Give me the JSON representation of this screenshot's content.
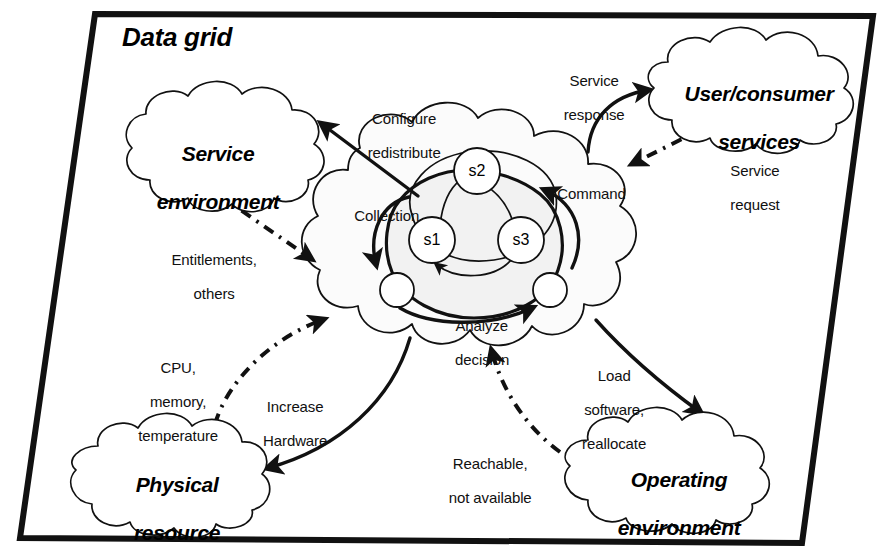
{
  "domain": "Diagram",
  "title": "Data grid",
  "colors": {
    "stroke": "#111111",
    "background": "#ffffff",
    "cloud_fill": "#ffffff",
    "inner_blob_fill": "#f2f2f2"
  },
  "frame": {
    "name": "data-grid-frame",
    "shape": "slanted-quadrilateral",
    "corners": [
      [
        95,
        14
      ],
      [
        873,
        16
      ],
      [
        802,
        543
      ],
      [
        20,
        538
      ]
    ]
  },
  "clouds": [
    {
      "id": "service-environment",
      "label": "Service\nenvironment",
      "line1": "Service",
      "line2": "environment",
      "cx": 207,
      "cy": 142
    },
    {
      "id": "user-consumer-services",
      "label": "User/consumer\nservices",
      "line1": "User/consumer",
      "line2": "services",
      "cx": 748,
      "cy": 85
    },
    {
      "id": "physical-resource",
      "label": "Physical\nresource",
      "line1": "Physical",
      "line2": "resource",
      "cx": 156,
      "cy": 473
    },
    {
      "id": "operating-environment",
      "label": "Operating\nenvironment",
      "line1": "Operating",
      "line2": "environment",
      "cx": 668,
      "cy": 468
    },
    {
      "id": "grid-cloud",
      "label": "",
      "line1": "",
      "line2": "",
      "cx": 470,
      "cy": 250
    }
  ],
  "nodes": [
    {
      "id": "s1",
      "label": "s1",
      "cx": 432,
      "cy": 240,
      "r": 23
    },
    {
      "id": "s2",
      "label": "s2",
      "cx": 477,
      "cy": 171,
      "r": 23
    },
    {
      "id": "s3",
      "label": "s3",
      "cx": 521,
      "cy": 240,
      "r": 23
    },
    {
      "id": "endpoint-left",
      "label": "",
      "cx": 397,
      "cy": 290,
      "r": 17
    },
    {
      "id": "endpoint-right",
      "label": "",
      "cx": 550,
      "cy": 290,
      "r": 17
    }
  ],
  "edge_labels": [
    {
      "id": "configure-redistribute",
      "text": "Configure\nredistribute",
      "line1": "Configure",
      "line2": "redistribute",
      "x": 396,
      "y": 93,
      "align": "center"
    },
    {
      "id": "collection",
      "text": "Collection",
      "line1": "Collection",
      "line2": "",
      "x": 338,
      "y": 190,
      "align": "left"
    },
    {
      "id": "entitlements-others",
      "text": "Entitlements,\nothers",
      "line1": "Entitlements,",
      "line2": "others",
      "x": 206,
      "y": 234,
      "align": "center"
    },
    {
      "id": "cpu-memory-temperature",
      "text": "CPU,\nmemory,\ntemperature",
      "line1": "CPU,",
      "line2": "memory,",
      "line3": "temperature",
      "x": 170,
      "y": 342,
      "align": "center"
    },
    {
      "id": "increase-hardware",
      "text": "Increase\nHardware",
      "line1": "Increase",
      "line2": "Hardware",
      "x": 287,
      "y": 381,
      "align": "center"
    },
    {
      "id": "analyze-decision",
      "text": "Analyze\ndecision",
      "line1": "Analyze",
      "line2": "decision",
      "x": 474,
      "y": 300,
      "align": "center"
    },
    {
      "id": "service-response",
      "text": "Service\nresponse",
      "line1": "Service",
      "line2": "response",
      "x": 586,
      "y": 55,
      "align": "center"
    },
    {
      "id": "command",
      "text": "Command",
      "line1": "Command",
      "line2": "",
      "x": 584,
      "y": 168,
      "align": "left"
    },
    {
      "id": "service-request",
      "text": "Service\nrequest",
      "line1": "Service",
      "line2": "request",
      "x": 714,
      "y": 145,
      "align": "left"
    },
    {
      "id": "load-software-reallocate",
      "text": "Load\nsoftware,\nreallocate",
      "line1": "Load",
      "line2": "software,",
      "line3": "reallocate",
      "x": 606,
      "y": 350,
      "align": "center"
    },
    {
      "id": "reachable-not-available",
      "text": "Reachable,\nnot available",
      "line1": "Reachable,",
      "line2": "not available",
      "x": 482,
      "y": 438,
      "align": "center"
    }
  ],
  "edges": [
    {
      "id": "grid-to-service-environment",
      "style": "solid",
      "from": "grid-cloud",
      "to": "service-environment",
      "label": "configure-redistribute"
    },
    {
      "id": "service-environment-to-grid",
      "style": "dash-dot",
      "from": "service-environment",
      "to": "grid-cloud",
      "label": "entitlements-others"
    },
    {
      "id": "physical-resource-to-grid",
      "style": "dash-dot",
      "from": "physical-resource",
      "to": "grid-cloud",
      "label": "cpu-memory-temperature"
    },
    {
      "id": "grid-to-physical-resource",
      "style": "solid",
      "from": "grid-cloud",
      "to": "physical-resource",
      "label": "increase-hardware"
    },
    {
      "id": "grid-to-user-services",
      "style": "solid",
      "from": "grid-cloud",
      "to": "user-consumer-services",
      "label": "service-response"
    },
    {
      "id": "user-services-to-grid",
      "style": "dash-dot",
      "from": "user-consumer-services",
      "to": "grid-cloud",
      "label": "service-request"
    },
    {
      "id": "grid-to-operating-env",
      "style": "solid",
      "from": "grid-cloud",
      "to": "operating-environment",
      "label": "load-software-reallocate"
    },
    {
      "id": "operating-env-to-grid",
      "style": "dash-dot",
      "from": "operating-environment",
      "to": "grid-cloud",
      "label": "reachable-not-available"
    },
    {
      "id": "s1-to-s2",
      "style": "solid-thin",
      "from": "s1",
      "to": "s2",
      "label": ""
    },
    {
      "id": "s3-to-s2",
      "style": "solid-thin",
      "from": "s3",
      "to": "s2",
      "label": ""
    },
    {
      "id": "s3-to-s1",
      "style": "solid-thin",
      "from": "s3",
      "to": "s1",
      "label": ""
    },
    {
      "id": "inner-loop-collection",
      "style": "solid",
      "from": "grid-cloud",
      "to": "endpoint-left",
      "label": "collection"
    },
    {
      "id": "inner-loop-command",
      "style": "solid",
      "from": "endpoint-right",
      "to": "s3",
      "label": "command"
    }
  ]
}
